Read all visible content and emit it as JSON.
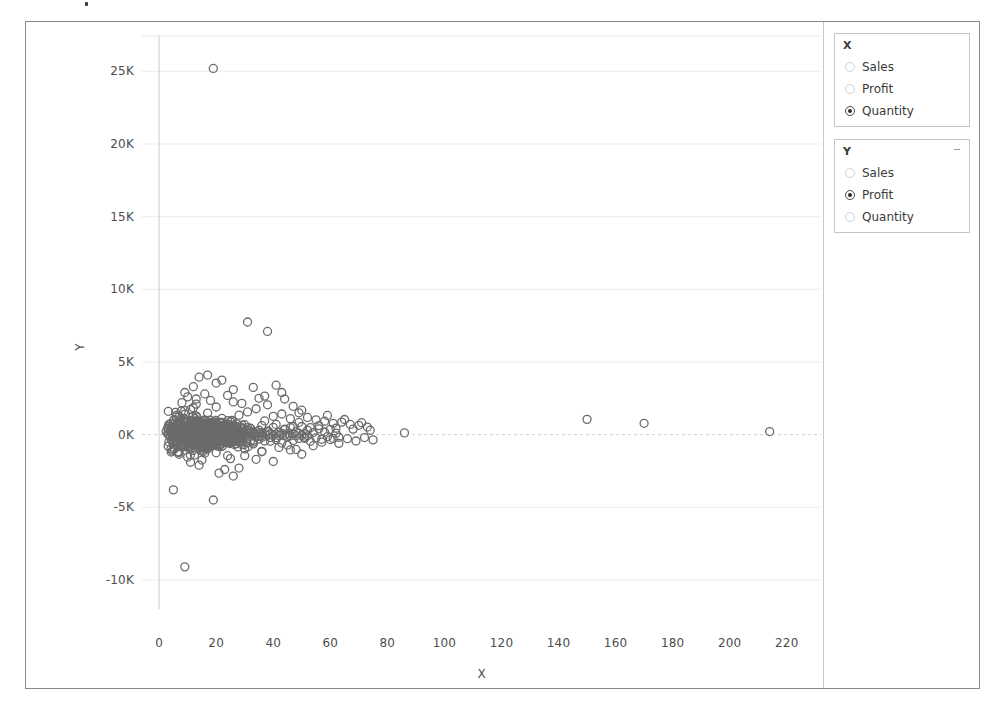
{
  "window": {
    "frame_border_color": "#8a8a8a",
    "background": "#ffffff"
  },
  "controls": {
    "x_panel": {
      "title": "X",
      "caret_icon": "chevron-down-icon",
      "options": [
        {
          "label": "Sales",
          "selected": false
        },
        {
          "label": "Profit",
          "selected": false
        },
        {
          "label": "Quantity",
          "selected": true
        }
      ]
    },
    "y_panel": {
      "title": "Y",
      "caret_icon": "chevron-down-icon",
      "options": [
        {
          "label": "Sales",
          "selected": false
        },
        {
          "label": "Profit",
          "selected": true
        },
        {
          "label": "Quantity",
          "selected": false
        }
      ]
    }
  },
  "chart_data": {
    "type": "scatter",
    "title": "",
    "xlabel": "X",
    "ylabel": "Y",
    "grid": true,
    "legend": "none",
    "marker": {
      "shape": "circle-open",
      "edge_color": "#6b6b6b",
      "fill": "none",
      "size": 8
    },
    "xlim": [
      -6,
      232
    ],
    "ylim": [
      -12000,
      27500
    ],
    "xticks": [
      0,
      20,
      40,
      60,
      80,
      100,
      120,
      140,
      160,
      180,
      200,
      220
    ],
    "xticklabels": [
      "0",
      "20",
      "40",
      "60",
      "80",
      "100",
      "120",
      "140",
      "160",
      "180",
      "200",
      "220"
    ],
    "yticks": [
      25000,
      20000,
      15000,
      10000,
      5000,
      0,
      -5000,
      -10000
    ],
    "yticklabels": [
      "25K",
      "20K",
      "15K",
      "10K",
      "5K",
      "0K",
      "-5K",
      "-10K"
    ],
    "x_field": "Quantity",
    "y_field": "Profit",
    "notable_points": [
      {
        "x": 19,
        "y": 25200,
        "note": "top outlier"
      },
      {
        "x": 31,
        "y": 7750
      },
      {
        "x": 38,
        "y": 7100
      },
      {
        "x": 9,
        "y": -9100,
        "note": "bottom outlier"
      },
      {
        "x": 5,
        "y": -3800
      },
      {
        "x": 19,
        "y": -4500
      },
      {
        "x": 86,
        "y": 120
      },
      {
        "x": 150,
        "y": 1050
      },
      {
        "x": 170,
        "y": 780
      },
      {
        "x": 214,
        "y": 210
      }
    ],
    "points": [
      [
        14,
        3950
      ],
      [
        17,
        4100
      ],
      [
        22,
        3750
      ],
      [
        12,
        3300
      ],
      [
        9,
        2900
      ],
      [
        20,
        3550
      ],
      [
        26,
        3100
      ],
      [
        33,
        3250
      ],
      [
        41,
        3400
      ],
      [
        37,
        2650
      ],
      [
        31,
        7750
      ],
      [
        38,
        7100
      ],
      [
        19,
        25200
      ],
      [
        9,
        -9100
      ],
      [
        5,
        -3800
      ],
      [
        19,
        -4500
      ],
      [
        86,
        120
      ],
      [
        150,
        1050
      ],
      [
        170,
        780
      ],
      [
        214,
        210
      ],
      [
        6,
        1200
      ],
      [
        7,
        850
      ],
      [
        8,
        430
      ],
      [
        9,
        1650
      ],
      [
        10,
        -220
      ],
      [
        11,
        980
      ],
      [
        12,
        -560
      ],
      [
        13,
        2100
      ],
      [
        14,
        340
      ],
      [
        15,
        -1100
      ],
      [
        16,
        720
      ],
      [
        17,
        1480
      ],
      [
        18,
        -380
      ],
      [
        19,
        260
      ],
      [
        20,
        1900
      ],
      [
        21,
        -820
      ],
      [
        22,
        1120
      ],
      [
        23,
        540
      ],
      [
        24,
        -1450
      ],
      [
        25,
        880
      ],
      [
        26,
        2250
      ],
      [
        27,
        -300
      ],
      [
        28,
        1340
      ],
      [
        29,
        660
      ],
      [
        30,
        -980
      ],
      [
        31,
        1560
      ],
      [
        32,
        420
      ],
      [
        33,
        -640
      ],
      [
        34,
        1780
      ],
      [
        35,
        300
      ],
      [
        36,
        -1180
      ],
      [
        37,
        940
      ],
      [
        38,
        2050
      ],
      [
        39,
        -460
      ],
      [
        40,
        1260
      ],
      [
        41,
        700
      ],
      [
        42,
        -880
      ],
      [
        43,
        1420
      ],
      [
        44,
        380
      ],
      [
        45,
        -720
      ],
      [
        46,
        1100
      ],
      [
        47,
        560
      ],
      [
        48,
        -1020
      ],
      [
        49,
        840
      ],
      [
        50,
        1680
      ],
      [
        51,
        -260
      ],
      [
        52,
        1180
      ],
      [
        53,
        480
      ],
      [
        54,
        -760
      ],
      [
        55,
        1020
      ],
      [
        56,
        620
      ],
      [
        57,
        -520
      ],
      [
        58,
        920
      ],
      [
        59,
        1320
      ],
      [
        60,
        -340
      ],
      [
        61,
        780
      ],
      [
        62,
        440
      ],
      [
        63,
        -600
      ],
      [
        64,
        860
      ],
      [
        65,
        1040
      ],
      [
        66,
        -280
      ],
      [
        67,
        700
      ],
      [
        68,
        380
      ],
      [
        69,
        -440
      ],
      [
        70,
        640
      ],
      [
        71,
        820
      ],
      [
        72,
        -200
      ],
      [
        73,
        520
      ],
      [
        74,
        300
      ],
      [
        75,
        -360
      ],
      [
        4,
        180
      ],
      [
        5,
        -140
      ],
      [
        6,
        -420
      ],
      [
        7,
        260
      ],
      [
        8,
        -680
      ],
      [
        9,
        120
      ],
      [
        10,
        520
      ],
      [
        11,
        -260
      ],
      [
        12,
        380
      ],
      [
        13,
        -540
      ],
      [
        14,
        180
      ],
      [
        15,
        640
      ],
      [
        16,
        -320
      ],
      [
        17,
        420
      ],
      [
        18,
        -180
      ],
      [
        19,
        760
      ],
      [
        20,
        -420
      ],
      [
        21,
        240
      ],
      [
        22,
        -600
      ],
      [
        23,
        380
      ],
      [
        24,
        120
      ],
      [
        25,
        -480
      ],
      [
        26,
        560
      ],
      [
        27,
        -240
      ],
      [
        28,
        320
      ],
      [
        29,
        -380
      ],
      [
        30,
        680
      ],
      [
        31,
        -160
      ],
      [
        32,
        440
      ],
      [
        33,
        -520
      ],
      [
        34,
        200
      ],
      [
        35,
        -300
      ],
      [
        36,
        620
      ],
      [
        37,
        -440
      ],
      [
        38,
        260
      ],
      [
        39,
        -200
      ],
      [
        40,
        500
      ],
      [
        41,
        -340
      ],
      [
        42,
        160
      ],
      [
        43,
        -580
      ],
      [
        44,
        340
      ],
      [
        45,
        -120
      ],
      [
        46,
        480
      ],
      [
        47,
        -400
      ],
      [
        48,
        220
      ],
      [
        49,
        -260
      ],
      [
        50,
        560
      ],
      [
        51,
        -180
      ],
      [
        52,
        300
      ],
      [
        53,
        -460
      ],
      [
        54,
        140
      ],
      [
        55,
        -220
      ],
      [
        56,
        400
      ],
      [
        57,
        -320
      ],
      [
        58,
        180
      ],
      [
        59,
        -140
      ],
      [
        60,
        360
      ],
      [
        61,
        -260
      ],
      [
        62,
        100
      ],
      [
        63,
        -180
      ],
      [
        3,
        60
      ],
      [
        4,
        -80
      ],
      [
        5,
        40
      ],
      [
        6,
        -60
      ],
      [
        7,
        90
      ],
      [
        8,
        -40
      ],
      [
        9,
        70
      ],
      [
        10,
        -90
      ],
      [
        11,
        50
      ],
      [
        12,
        -70
      ],
      [
        13,
        80
      ],
      [
        14,
        -50
      ],
      [
        15,
        60
      ],
      [
        16,
        -80
      ],
      [
        17,
        40
      ],
      [
        18,
        -60
      ],
      [
        19,
        90
      ],
      [
        20,
        -40
      ],
      [
        21,
        70
      ],
      [
        22,
        -90
      ],
      [
        23,
        50
      ],
      [
        24,
        -70
      ],
      [
        25,
        80
      ],
      [
        26,
        -50
      ],
      [
        27,
        60
      ],
      [
        28,
        -80
      ],
      [
        29,
        40
      ],
      [
        30,
        -60
      ],
      [
        31,
        90
      ],
      [
        32,
        -40
      ],
      [
        33,
        70
      ],
      [
        34,
        -90
      ],
      [
        35,
        50
      ],
      [
        36,
        -70
      ],
      [
        37,
        80
      ],
      [
        38,
        -50
      ],
      [
        39,
        60
      ],
      [
        40,
        -80
      ],
      [
        41,
        40
      ],
      [
        42,
        -60
      ],
      [
        43,
        90
      ],
      [
        44,
        -40
      ],
      [
        45,
        70
      ],
      [
        46,
        -90
      ],
      [
        47,
        50
      ],
      [
        48,
        -70
      ],
      [
        49,
        80
      ],
      [
        50,
        -50
      ],
      [
        51,
        60
      ],
      [
        52,
        -80
      ],
      [
        10,
        2600
      ],
      [
        13,
        2450
      ],
      [
        16,
        2800
      ],
      [
        11,
        -1900
      ],
      [
        14,
        -2100
      ],
      [
        23,
        -2400
      ],
      [
        28,
        -2300
      ],
      [
        34,
        -1700
      ],
      [
        21,
        -2650
      ],
      [
        26,
        -2850
      ],
      [
        8,
        2200
      ],
      [
        12,
        1850
      ],
      [
        18,
        2350
      ],
      [
        24,
        2700
      ],
      [
        29,
        2150
      ],
      [
        35,
        2500
      ],
      [
        43,
        2900
      ],
      [
        47,
        1950
      ],
      [
        44,
        2450
      ],
      [
        49,
        1500
      ],
      [
        7,
        -1350
      ],
      [
        10,
        -1550
      ],
      [
        15,
        -1750
      ],
      [
        20,
        -1250
      ],
      [
        25,
        -1650
      ],
      [
        30,
        -1450
      ],
      [
        36,
        -1150
      ],
      [
        40,
        -1850
      ],
      [
        46,
        -1050
      ],
      [
        50,
        -1350
      ]
    ]
  }
}
